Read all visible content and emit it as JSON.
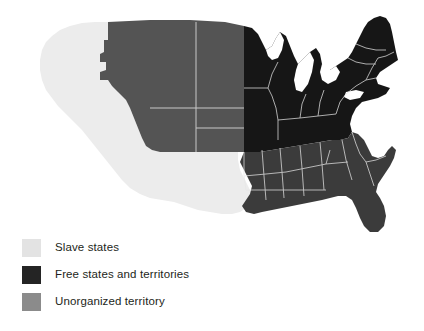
{
  "figure": {
    "type": "choropleth-map",
    "background_color": "#ffffff"
  },
  "legend": {
    "items": [
      {
        "label": "Slave states",
        "color": "#e3e3e3",
        "swatch_name": "legend-swatch-slave-states"
      },
      {
        "label": "Free states and territories",
        "color": "#242424",
        "swatch_name": "legend-swatch-free-states"
      },
      {
        "label": "Unorganized territory",
        "color": "#8b8b8b",
        "swatch_name": "legend-swatch-unorganized-territory"
      }
    ]
  },
  "map": {
    "region_colors": {
      "slave_states": "#3b3b3b",
      "free_states": "#161616",
      "unorganized_territory": "#545454",
      "western_territory": "#ececec",
      "border_line": "#f0f0f0"
    },
    "regions": [
      {
        "name": "western-territory",
        "category": "Slave states",
        "description": "Pacific coast and southwestern territories"
      },
      {
        "name": "unorganized-territory",
        "category": "Unorganized territory",
        "description": "Northern plains and upper Missouri basin"
      },
      {
        "name": "free-states-north",
        "category": "Free states and territories",
        "description": "Great Lakes, Mid-Atlantic and New England"
      },
      {
        "name": "slave-states-south",
        "category": "Slave states",
        "description": "Southeastern and Gulf states"
      }
    ]
  }
}
